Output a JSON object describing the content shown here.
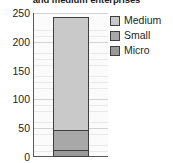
{
  "chart_data": {
    "type": "bar",
    "title": "and medium enterprises",
    "xlabel": "",
    "ylabel": "",
    "categories": [
      ""
    ],
    "stacked": true,
    "ylim": [
      0,
      250
    ],
    "yticks": [
      0,
      50,
      100,
      150,
      200,
      250
    ],
    "ytick_labels": [
      "0",
      "50",
      "100",
      "150",
      "200",
      "250"
    ],
    "grid": "horizontal",
    "legend_position": "right",
    "series": [
      {
        "name": "Micro",
        "values": [
          13
        ],
        "color": "#9a9a9a"
      },
      {
        "name": "Small",
        "values": [
          36
        ],
        "color": "#a8a8a8"
      },
      {
        "name": "Medium",
        "values": [
          199
        ],
        "color": "#c9c9c9"
      }
    ],
    "stack_order_bottom_to_top": [
      "Micro",
      "Small",
      "Medium"
    ],
    "total": 248,
    "segment_boundaries": [
      0,
      13,
      49,
      248
    ]
  },
  "axis": {
    "ticks": [
      {
        "label": "250",
        "value": 250
      },
      {
        "label": "200",
        "value": 200
      },
      {
        "label": "150",
        "value": 150
      },
      {
        "label": "100",
        "value": 100
      },
      {
        "label": "50",
        "value": 50
      },
      {
        "label": "0",
        "value": 0
      }
    ]
  },
  "legend": {
    "items": [
      {
        "label": "Medium",
        "color": "#c9c9c9"
      },
      {
        "label": "Small",
        "color": "#a8a8a8"
      },
      {
        "label": "Micro",
        "color": "#9a9a9a"
      }
    ]
  },
  "colors": {
    "axis": "#58595b",
    "text": "#231f20",
    "outline": "#3f3f40",
    "grid_minor": "#e9e9e9",
    "grid_major": "#d2d2d2",
    "plot_background": "#fbfbfb"
  }
}
